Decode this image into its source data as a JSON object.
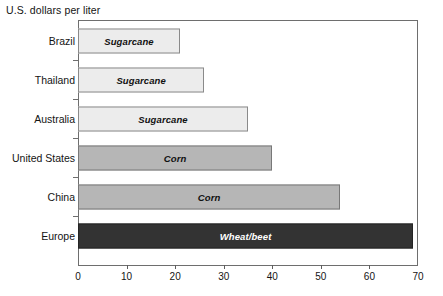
{
  "chart_data": {
    "type": "bar",
    "orientation": "horizontal",
    "title": "U.S. dollars per liter",
    "xlabel": "",
    "ylabel": "",
    "xlim": [
      0,
      70
    ],
    "xticks": [
      0,
      10,
      20,
      30,
      40,
      50,
      60,
      70
    ],
    "grid": false,
    "legend": "none",
    "categories": [
      "Brazil",
      "Thailand",
      "Australia",
      "United States",
      "China",
      "Europe"
    ],
    "values": [
      21,
      26,
      35,
      40,
      54,
      69
    ],
    "bar_labels": [
      "Sugarcane",
      "Sugarcane",
      "Sugarcane",
      "Corn",
      "Corn",
      "Wheat/beet"
    ],
    "bar_styles": [
      "light",
      "light",
      "light",
      "medium",
      "medium",
      "dark"
    ],
    "colors": {
      "light": "#ececec",
      "medium": "#b6b6b6",
      "dark": "#333333",
      "axis": "#6e6e6e",
      "text": "#141414"
    },
    "bars": [
      {
        "category": "Brazil",
        "value": 21,
        "label": "Sugarcane",
        "style": "light"
      },
      {
        "category": "Thailand",
        "value": 26,
        "label": "Sugarcane",
        "style": "light"
      },
      {
        "category": "Australia",
        "value": 35,
        "label": "Sugarcane",
        "style": "light"
      },
      {
        "category": "United States",
        "value": 40,
        "label": "Corn",
        "style": "medium"
      },
      {
        "category": "China",
        "value": 54,
        "label": "Corn",
        "style": "medium"
      },
      {
        "category": "Europe",
        "value": 69,
        "label": "Wheat/beet",
        "style": "dark"
      }
    ]
  },
  "axis": {
    "tick_labels": [
      "0",
      "10",
      "20",
      "30",
      "40",
      "50",
      "60",
      "70"
    ]
  }
}
